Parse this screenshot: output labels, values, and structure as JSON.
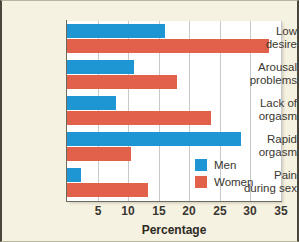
{
  "figure": {
    "background_color": "#f6f2e2",
    "plot_background_color": "#ffffff",
    "title_sliver": "",
    "men_color": "#1f96d4",
    "women_color": "#e2614a"
  },
  "chart_data": {
    "type": "bar",
    "orientation": "horizontal",
    "title": "",
    "xlabel": "Percentage",
    "ylabel": "",
    "categories": [
      "Low desire",
      "Arousal problems",
      "Lack of orgasm",
      "Rapid orgasm",
      "Pain during sex"
    ],
    "category_lines": [
      [
        "Low",
        "desire"
      ],
      [
        "Arousal",
        "problems"
      ],
      [
        "Lack of",
        "orgasm"
      ],
      [
        "Rapid",
        "orgasm"
      ],
      [
        "Pain",
        "during sex"
      ]
    ],
    "series": [
      {
        "name": "Men",
        "color": "#1f96d4",
        "values": [
          16.0,
          11.0,
          8.0,
          28.5,
          2.3
        ]
      },
      {
        "name": "Women",
        "color": "#e2614a",
        "values": [
          33.0,
          18.0,
          23.5,
          10.5,
          13.3
        ]
      }
    ],
    "xlim": [
      0,
      35
    ],
    "xticks": [
      5,
      10,
      15,
      20,
      25,
      30,
      35
    ],
    "xtick_labels": [
      "5",
      "10",
      "15",
      "20",
      "25",
      "30",
      "35"
    ],
    "grid": "vertical",
    "legend": {
      "position": "inside-lower-right",
      "entries": [
        {
          "label": "Men",
          "color": "#1f96d4"
        },
        {
          "label": "Women",
          "color": "#e2614a"
        }
      ]
    }
  }
}
